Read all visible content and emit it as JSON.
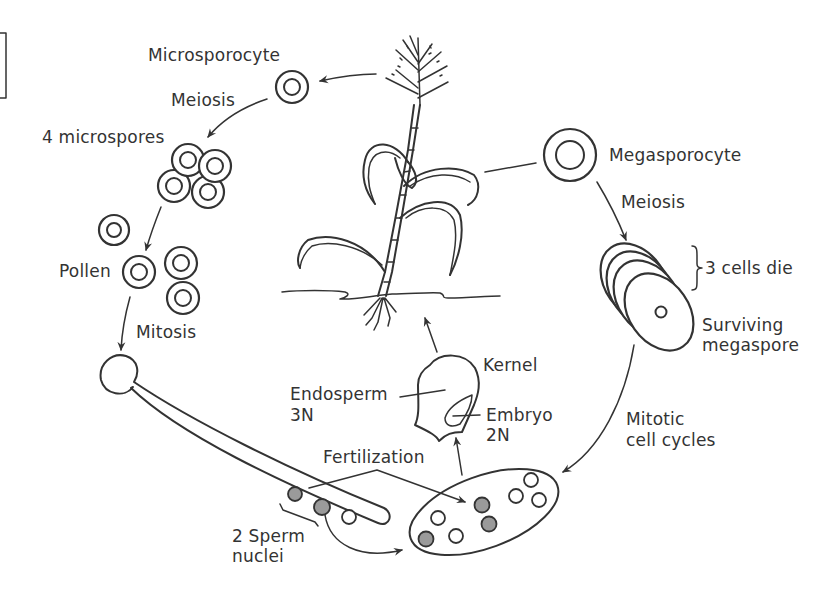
{
  "diagram": {
    "type": "life-cycle",
    "labels": {
      "microsporocyte": "Microsporocyte",
      "meiosis_left": "Meiosis",
      "four_microspores": "4 microspores",
      "pollen": "Pollen",
      "mitosis": "Mitosis",
      "megasporocyte": "Megasporocyte",
      "meiosis_right": "Meiosis",
      "three_cells_die": "3 cells die",
      "surviving_line1": "Surviving",
      "surviving_line2": "megaspore",
      "mitotic_line1": "Mitotic",
      "mitotic_line2": "cell cycles",
      "kernel": "Kernel",
      "endosperm_line1": "Endosperm",
      "endosperm_line2": "3N",
      "embryo_line1": "Embryo",
      "embryo_line2": "2N",
      "fertilization": "Fertilization",
      "sperm_line1": "2 Sperm",
      "sperm_line2": "nuclei"
    },
    "nodes": [
      {
        "id": "plant",
        "label": "Maize plant"
      },
      {
        "id": "microsporocyte",
        "label": "Microsporocyte"
      },
      {
        "id": "microspores",
        "label": "4 microspores"
      },
      {
        "id": "pollen",
        "label": "Pollen"
      },
      {
        "id": "pollen_tube",
        "label": "Pollen tube with 2 Sperm nuclei"
      },
      {
        "id": "megasporocyte",
        "label": "Megasporocyte"
      },
      {
        "id": "megaspores",
        "label": "3 cells die / Surviving megaspore"
      },
      {
        "id": "embryo_sac",
        "label": "Embryo sac"
      },
      {
        "id": "kernel",
        "label": "Kernel (Endosperm 3N, Embryo 2N)"
      }
    ],
    "edges": [
      {
        "from": "plant",
        "to": "microsporocyte",
        "label": ""
      },
      {
        "from": "microsporocyte",
        "to": "microspores",
        "label": "Meiosis"
      },
      {
        "from": "microspores",
        "to": "pollen",
        "label": ""
      },
      {
        "from": "pollen",
        "to": "pollen_tube",
        "label": "Mitosis"
      },
      {
        "from": "plant",
        "to": "megasporocyte",
        "label": ""
      },
      {
        "from": "megasporocyte",
        "to": "megaspores",
        "label": "Meiosis"
      },
      {
        "from": "megaspores",
        "to": "embryo_sac",
        "label": "Mitotic cell cycles"
      },
      {
        "from": "pollen_tube",
        "to": "embryo_sac",
        "label": "Fertilization"
      },
      {
        "from": "embryo_sac",
        "to": "kernel",
        "label": ""
      },
      {
        "from": "kernel",
        "to": "plant",
        "label": ""
      }
    ],
    "colors": {
      "line": "#333333",
      "sperm_fill": "#9a9a9a",
      "background": "#ffffff"
    }
  }
}
